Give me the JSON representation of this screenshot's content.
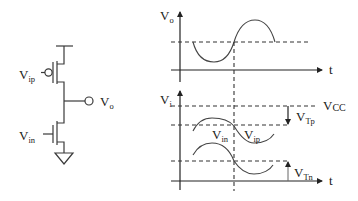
{
  "circuit": {
    "labels": {
      "vip_main": "V",
      "vip_sub": "ip",
      "vin_main": "V",
      "vin_sub": "in",
      "vo_main": "V",
      "vo_sub": "o"
    },
    "components": [
      "pmos-transistor",
      "nmos-transistor",
      "vdd-rail",
      "ground",
      "output-node"
    ]
  },
  "top_plot": {
    "y_label_main": "V",
    "y_label_sub": "o",
    "x_label": "t",
    "waveform": "sine",
    "dashed_reference": "dc-level"
  },
  "bottom_plot": {
    "y_label_main": "V",
    "y_label_sub": "i",
    "x_label": "t",
    "levels": {
      "vcc_main": "V",
      "vcc_sub": "CC",
      "vtp_main": "V",
      "vtp_sub": "Tp",
      "vtn_main": "V",
      "vtn_sub": "Tn"
    },
    "curve_labels": {
      "vin_main": "V",
      "vin_sub": "in",
      "vip_main": "V",
      "vip_sub": "ip"
    }
  },
  "colors": {
    "line": "#333333",
    "background": "#ffffff"
  }
}
